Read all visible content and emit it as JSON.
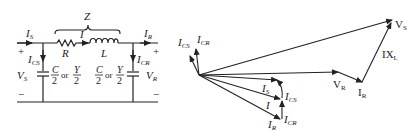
{
  "circuit": {
    "impedance_label": "Z",
    "source_current": {
      "main": "I",
      "sub": "S"
    },
    "line_current": {
      "main": "I",
      "sub": ""
    },
    "receiving_current": {
      "main": "I",
      "sub": "R"
    },
    "resistor_label": "R",
    "inductor_label": "L",
    "source_cap_current": {
      "main": "I",
      "sub": "CS"
    },
    "receiving_cap_current": {
      "main": "I",
      "sub": "CR"
    },
    "source_voltage": {
      "main": "V",
      "sub": "S"
    },
    "receiving_voltage": {
      "main": "V",
      "sub": "R"
    },
    "plus": "+",
    "minus": "−",
    "cap_label_left": {
      "c_num": "C",
      "den": "2",
      "or": "or",
      "y_num": "Y"
    },
    "cap_label_right": {
      "c_num": "C",
      "den": "2",
      "or": "or",
      "y_num": "Y"
    }
  },
  "phasor": {
    "vs": {
      "main": "V",
      "sub": "S"
    },
    "vr": {
      "main": "V",
      "sub": "R"
    },
    "ir_drop": {
      "main": "I",
      "sub": "R"
    },
    "ixl": {
      "main": "IX",
      "sub": "L"
    },
    "ics": {
      "main": "I",
      "sub": "CS"
    },
    "icr": {
      "main": "I",
      "sub": "CR"
    },
    "is": {
      "main": "I",
      "sub": "S"
    },
    "i": {
      "main": "I",
      "sub": ""
    },
    "ics_small": {
      "main": "I",
      "sub": "CS"
    },
    "ir": {
      "main": "I",
      "sub": "R"
    },
    "icr_small": {
      "main": "I",
      "sub": "CR"
    }
  }
}
